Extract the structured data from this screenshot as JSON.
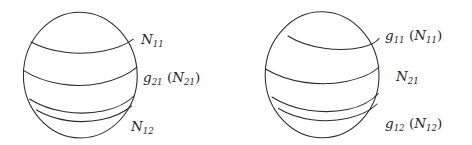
{
  "figure": {
    "background_color": "#ffffff",
    "ink_color": "#2b2b2b",
    "width": 472,
    "height": 145
  },
  "spheres": [
    {
      "name": "left-sphere",
      "cx": 80,
      "cy": 75,
      "rx": 57,
      "ry": 63,
      "band_count": 4,
      "labels": [
        {
          "id": "left-label-top",
          "name": "N11",
          "base": "N",
          "sub": "11",
          "suffix": "",
          "text": "N₁₁",
          "x": 141,
          "y": 44
        },
        {
          "id": "left-label-middle",
          "name": "g21(N21)",
          "base": "g",
          "sub": "21",
          "suffix": "(N₂₁)",
          "text": "g₂₁ (N₂₁)",
          "x": 143,
          "y": 82
        },
        {
          "id": "left-label-bottom",
          "name": "N12",
          "base": "N",
          "sub": "12",
          "suffix": "",
          "text": "N₁₂",
          "x": 131,
          "y": 131
        }
      ]
    },
    {
      "name": "right-sphere",
      "cx": 322,
      "cy": 75,
      "rx": 57,
      "ry": 63,
      "band_count": 4,
      "labels": [
        {
          "id": "right-label-top",
          "name": "g11(N11)",
          "base": "g",
          "sub": "11",
          "suffix": "(N₁₁)",
          "text": "g₁₁ (N₁₁)",
          "x": 385,
          "y": 40
        },
        {
          "id": "right-label-middle",
          "name": "N21",
          "base": "N",
          "sub": "21",
          "suffix": "",
          "text": "N₂₁",
          "x": 396,
          "y": 81
        },
        {
          "id": "right-label-bottom",
          "name": "g12(N12)",
          "base": "g",
          "sub": "12",
          "suffix": "(N₁₂)",
          "text": "g₁₂ (N₁₂)",
          "x": 385,
          "y": 128
        }
      ]
    }
  ]
}
